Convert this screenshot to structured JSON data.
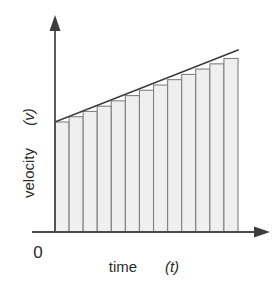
{
  "figure": {
    "name": "velocity-time-riemann-sum",
    "background_color": "#ffffff"
  },
  "axes": {
    "x_axis": {
      "label_main": "time",
      "label_variable": "(t)",
      "label_full": "time (t)",
      "arrow": "arrow-right-icon",
      "color": "#4a4a4a"
    },
    "y_axis": {
      "label_main": "velocity",
      "label_variable": "(v)",
      "label_full": "velocity (v)",
      "arrow": "arrow-up-icon",
      "color": "#4a4a4a"
    },
    "origin_label": "0"
  },
  "colors": {
    "axis": "#4a4a4a",
    "line": "#3c3c3c",
    "bar_fill": "#efefef",
    "bar_stroke": "#808080",
    "text": "#2b2b2b"
  },
  "chart_data": {
    "type": "area",
    "title": "",
    "subtitle": "",
    "xlabel": "time (t)",
    "ylabel": "velocity (v)",
    "xlim": [
      0,
      13
    ],
    "ylim": [
      0,
      16.5
    ],
    "grid": false,
    "legend": null,
    "annotations": [
      "0"
    ],
    "line_series": {
      "name": "velocity",
      "x": [
        0,
        13
      ],
      "y": [
        8.0,
        13.0
      ],
      "style": "solid",
      "note": "straight line of constant positive slope; v increases linearly with t"
    },
    "bars": {
      "count": 13,
      "rule": "left-endpoint",
      "categories": [
        1,
        2,
        3,
        4,
        5,
        6,
        7,
        8,
        9,
        10,
        11,
        12,
        13
      ],
      "x_left_edges": [
        0,
        1,
        2,
        3,
        4,
        5,
        6,
        7,
        8,
        9,
        10,
        11,
        12
      ],
      "x_right_edges": [
        1,
        2,
        3,
        4,
        5,
        6,
        7,
        8,
        9,
        10,
        11,
        12,
        13
      ],
      "values": [
        8.0,
        8.38,
        8.77,
        9.15,
        9.54,
        9.92,
        10.31,
        10.69,
        11.08,
        11.46,
        11.85,
        12.23,
        12.62
      ]
    }
  }
}
